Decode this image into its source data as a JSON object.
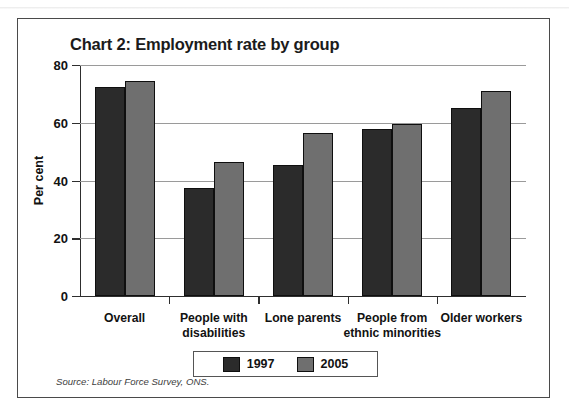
{
  "chart_data": {
    "type": "bar",
    "title": "Chart 2: Employment rate by group",
    "xlabel": "",
    "ylabel": "Per cent",
    "ylim": [
      0,
      80
    ],
    "yticks": [
      0,
      20,
      40,
      60,
      80
    ],
    "ytick_labels": [
      "0",
      "20",
      "40",
      "60",
      "80"
    ],
    "grid": true,
    "legend_position": "bottom",
    "categories": [
      "Overall",
      "People with disabilities",
      "Lone parents",
      "People from ethnic minorities",
      "Older workers"
    ],
    "category_lines": [
      [
        "Overall"
      ],
      [
        "People with",
        "disabilities"
      ],
      [
        "Lone parents"
      ],
      [
        "People from",
        "ethnic minorities"
      ],
      [
        "Older workers"
      ]
    ],
    "series": [
      {
        "name": "1997",
        "color": "#2b2b2b",
        "values": [
          72.5,
          37.5,
          45.5,
          58.0,
          65.0
        ]
      },
      {
        "name": "2005",
        "color": "#6f6f6f",
        "values": [
          74.5,
          46.5,
          56.5,
          59.5,
          71.0
        ]
      }
    ],
    "source": "Source: Labour Force Survey, ONS."
  },
  "legend": {
    "entries": [
      {
        "label": "1997",
        "color": "#2b2b2b"
      },
      {
        "label": "2005",
        "color": "#6f6f6f"
      }
    ]
  },
  "colors": {
    "series_1997": "#2b2b2b",
    "series_2005": "#6f6f6f",
    "axis": "#2e2e2e",
    "gridline": "#9a9a9a",
    "frame": "#4a4a4a",
    "text": "#121212",
    "background": "#ffffff"
  }
}
